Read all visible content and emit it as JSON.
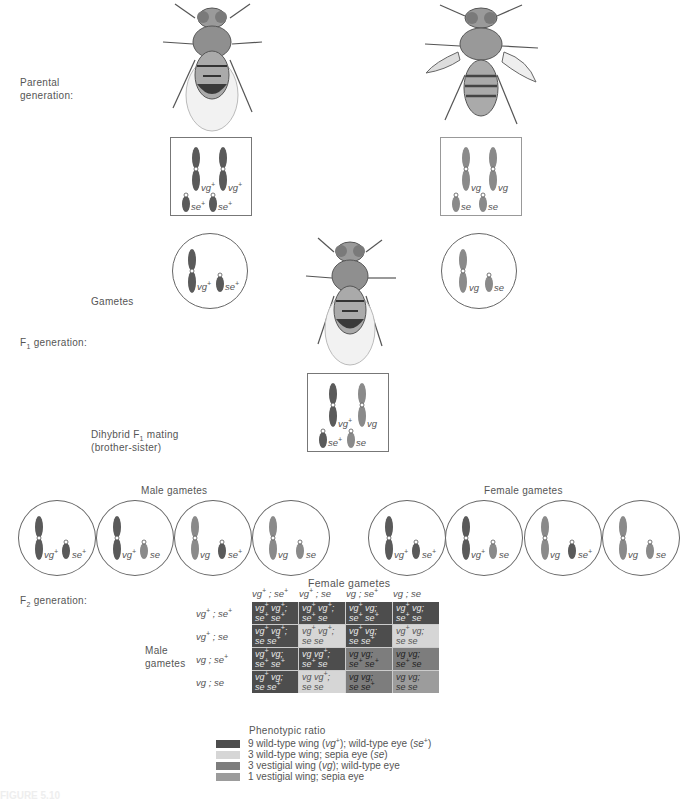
{
  "labels": {
    "parental": [
      "Parental",
      "generation:"
    ],
    "gametes": "Gametes",
    "f1": {
      "prefix": "F",
      "sub": "1",
      "suffix": " generation:"
    },
    "dihybrid": {
      "line1_prefix": "Dihybrid F",
      "line1_sub": "1",
      "line1_suffix": " mating",
      "line2": "(brother-sister)"
    },
    "male_gametes": "Male gametes",
    "female_gametes": "Female gametes",
    "f2": {
      "prefix": "F",
      "sub": "2",
      "suffix": " generation:"
    },
    "punnett_female_header": "Female gametes",
    "punnett_male_header": [
      "Male",
      "gametes"
    ],
    "caption_partial": "FIGURE 5.10"
  },
  "parents": {
    "left": {
      "fly": "wild-type fly",
      "genotype": [
        [
          "vg",
          "+"
        ],
        [
          "vg",
          "+"
        ],
        [
          "se",
          "+"
        ],
        [
          "se",
          "+"
        ]
      ]
    },
    "right": {
      "fly": "vestigial-wing sepia fly",
      "genotype": [
        [
          "vg",
          ""
        ],
        [
          "vg",
          ""
        ],
        [
          "se",
          ""
        ],
        [
          "se",
          ""
        ]
      ]
    }
  },
  "parent_gametes": {
    "left": [
      [
        "vg",
        "+"
      ],
      [
        "se",
        "+"
      ]
    ],
    "right": [
      [
        "vg",
        ""
      ],
      [
        "se",
        ""
      ]
    ]
  },
  "f1": {
    "genotype": [
      [
        "vg",
        "+"
      ],
      [
        "vg",
        ""
      ],
      [
        "se",
        "+"
      ],
      [
        "se",
        ""
      ]
    ]
  },
  "male_gametes": [
    [
      [
        "vg",
        "+"
      ],
      [
        "se",
        "+"
      ]
    ],
    [
      [
        "vg",
        "+"
      ],
      [
        "se",
        ""
      ]
    ],
    [
      [
        "vg",
        ""
      ],
      [
        "se",
        "+"
      ]
    ],
    [
      [
        "vg",
        ""
      ],
      [
        "se",
        ""
      ]
    ]
  ],
  "female_gametes": [
    [
      [
        "vg",
        "+"
      ],
      [
        "se",
        "+"
      ]
    ],
    [
      [
        "vg",
        "+"
      ],
      [
        "se",
        ""
      ]
    ],
    [
      [
        "vg",
        ""
      ],
      [
        "se",
        "+"
      ]
    ],
    [
      [
        "vg",
        ""
      ],
      [
        "se",
        ""
      ]
    ]
  ],
  "punnett": {
    "col_headers": [
      "vg+ ; se+",
      "vg+ ; se",
      "vg ; se+",
      "vg ; se"
    ],
    "row_headers": [
      "vg+ ; se+",
      "vg+ ; se",
      "vg ; se+",
      "vg ; se"
    ],
    "cells": [
      [
        {
          "l1": "vg+ vg+;",
          "l2": "se+ se+",
          "p": "9"
        },
        {
          "l1": "vg+ vg+;",
          "l2": "se+ se",
          "p": "9"
        },
        {
          "l1": "vg+ vg;",
          "l2": "se+ se+",
          "p": "9"
        },
        {
          "l1": "vg+ vg;",
          "l2": "se+ se",
          "p": "9"
        }
      ],
      [
        {
          "l1": "vg+ vg+;",
          "l2": "se se+",
          "p": "9"
        },
        {
          "l1": "vg+ vg+;",
          "l2": "se se",
          "p": "3s"
        },
        {
          "l1": "vg+ vg;",
          "l2": "se se+",
          "p": "9"
        },
        {
          "l1": "vg+ vg;",
          "l2": "se se",
          "p": "3s"
        }
      ],
      [
        {
          "l1": "vg+ vg;",
          "l2": "se+ se+",
          "p": "9"
        },
        {
          "l1": "vg vg+;",
          "l2": "se+ se",
          "p": "9"
        },
        {
          "l1": "vg vg;",
          "l2": "se+ se+",
          "p": "3v"
        },
        {
          "l1": "vg vg;",
          "l2": "se+ se",
          "p": "3v"
        }
      ],
      [
        {
          "l1": "vg+ vg;",
          "l2": "se se+",
          "p": "9"
        },
        {
          "l1": "vg vg+;",
          "l2": "se se",
          "p": "3s"
        },
        {
          "l1": "vg vg;",
          "l2": "se se+",
          "p": "3v"
        },
        {
          "l1": "vg vg;",
          "l2": "se se",
          "p": "1"
        }
      ]
    ]
  },
  "legend": {
    "title": "Phenotypic ratio",
    "items": [
      {
        "key": "9",
        "color": "#4d4d4d",
        "text": "9 wild-type wing (vg+); wild-type eye (se+)"
      },
      {
        "key": "3s",
        "color": "#d6d6d6",
        "text": "3 wild-type wing; sepia eye (se)"
      },
      {
        "key": "3v",
        "color": "#7d7d7d",
        "text": "3 vestigial wing (vg); wild-type eye"
      },
      {
        "key": "1",
        "color": "#9c9c9c",
        "text": "1 vestigial wing; sepia eye"
      }
    ]
  },
  "colors": {
    "chrom_dark": "#5a5a5a",
    "chrom_light": "#8a8a8a",
    "border": "#777777"
  }
}
